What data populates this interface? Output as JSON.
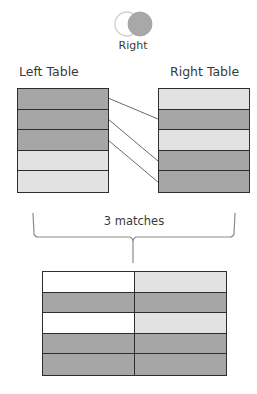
{
  "venn": {
    "label": "Right",
    "left_circle": {
      "fill": "#ffffff",
      "stroke": "#cfcfcf"
    },
    "right_circle": {
      "fill": "#a8a8a8",
      "stroke": "#a8a8a8"
    }
  },
  "left_table": {
    "title": "Left Table",
    "rows": [
      "dark",
      "dark",
      "dark",
      "light",
      "light"
    ]
  },
  "right_table": {
    "title": "Right Table",
    "rows": [
      "light",
      "dark",
      "light",
      "dark",
      "dark"
    ]
  },
  "connections": [
    {
      "from_left_row": 1,
      "to_right_row": 2
    },
    {
      "from_left_row": 2,
      "to_right_row": 4
    },
    {
      "from_left_row": 3,
      "to_right_row": 5
    }
  ],
  "brace": {
    "label": "3 matches"
  },
  "result_table": {
    "rows": [
      [
        "white",
        "light"
      ],
      [
        "dark",
        "dark"
      ],
      [
        "white",
        "light"
      ],
      [
        "dark",
        "dark"
      ],
      [
        "dark",
        "dark"
      ]
    ]
  },
  "colors": {
    "dark": "#a6a6a6",
    "light": "#e2e2e2",
    "white": "#ffffff",
    "border": "#2e2e2e",
    "connector": "#6a6a6a"
  }
}
